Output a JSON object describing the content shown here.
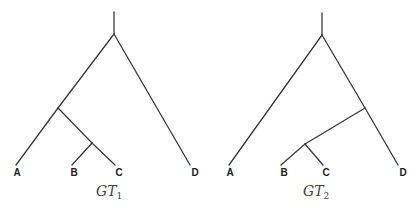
{
  "trees": [
    {
      "id": "GT1",
      "caption": {
        "main": "GT",
        "subscript": "1"
      },
      "topology": "((A,(B,C)),D)",
      "leaves": [
        {
          "label": "A",
          "x": 16,
          "y": 165
        },
        {
          "label": "B",
          "x": 72,
          "y": 165
        },
        {
          "label": "C",
          "x": 117,
          "y": 165
        },
        {
          "label": "D",
          "x": 191,
          "y": 165
        }
      ],
      "nodes": {
        "root_top": [
          114,
          12
        ],
        "root": [
          114,
          34
        ],
        "abc": [
          58,
          108
        ],
        "bc": [
          92,
          143
        ]
      }
    },
    {
      "id": "GT2",
      "caption": {
        "main": "GT",
        "subscript": "2"
      },
      "topology": "(A,((B,C),D))",
      "leaves": [
        {
          "label": "A",
          "x": 229,
          "y": 165
        },
        {
          "label": "B",
          "x": 282,
          "y": 165
        },
        {
          "label": "C",
          "x": 323,
          "y": 165
        },
        {
          "label": "D",
          "x": 399,
          "y": 165
        }
      ],
      "nodes": {
        "root_top": [
          322,
          13
        ],
        "root": [
          322,
          35
        ],
        "bcd": [
          365,
          108
        ],
        "bc": [
          305,
          144
        ]
      }
    }
  ],
  "colors": {
    "edge": "#3a3a3a",
    "label": "#222222",
    "caption": "#444444"
  }
}
